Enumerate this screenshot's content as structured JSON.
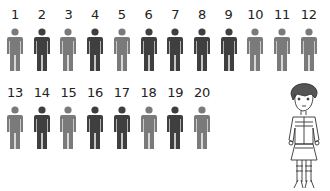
{
  "colors": {
    "dark": "#3f3f3f",
    "light": "#7a7a7a",
    "label": "#222222"
  },
  "figures": [
    {
      "n": "1",
      "tone": "light"
    },
    {
      "n": "2",
      "tone": "dark"
    },
    {
      "n": "3",
      "tone": "light"
    },
    {
      "n": "4",
      "tone": "dark"
    },
    {
      "n": "5",
      "tone": "light"
    },
    {
      "n": "6",
      "tone": "dark"
    },
    {
      "n": "7",
      "tone": "dark"
    },
    {
      "n": "8",
      "tone": "dark"
    },
    {
      "n": "9",
      "tone": "dark"
    },
    {
      "n": "10",
      "tone": "light"
    },
    {
      "n": "11",
      "tone": "light"
    },
    {
      "n": "12",
      "tone": "light"
    },
    {
      "n": "13",
      "tone": "light"
    },
    {
      "n": "14",
      "tone": "dark"
    },
    {
      "n": "15",
      "tone": "light"
    },
    {
      "n": "16",
      "tone": "dark"
    },
    {
      "n": "17",
      "tone": "dark"
    },
    {
      "n": "18",
      "tone": "light"
    },
    {
      "n": "19",
      "tone": "dark"
    },
    {
      "n": "20",
      "tone": "light"
    }
  ],
  "character": {
    "icon": "girl-character-illustration"
  }
}
